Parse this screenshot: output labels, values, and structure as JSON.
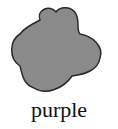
{
  "figure": {
    "shape": "blob",
    "fill_color": "#8a8a8a",
    "outline_color": "#2a2a2a",
    "label": "purple"
  }
}
